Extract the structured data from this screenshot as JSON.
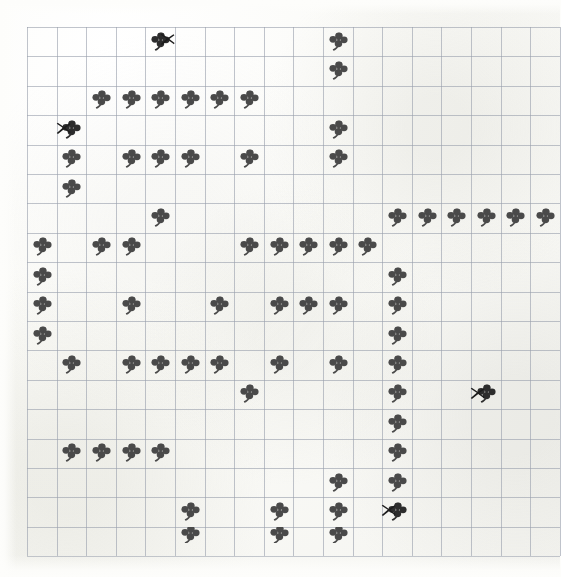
{
  "chart_data": {
    "type": "heatmap",
    "title": "",
    "subtitle": "",
    "xlabel": "",
    "ylabel": "",
    "grid": {
      "columns": 18,
      "rows": 18,
      "cell_width": 29.6,
      "cell_height": 29.4,
      "origin_x": 27,
      "origin_y": 27,
      "line_color": "#9aa0ad",
      "grid_on": true
    },
    "legend": [
      {
        "key": "clover",
        "label": "four-leaf clover stitch",
        "color": "#4a4a4a"
      },
      {
        "key": "clover-x",
        "label": "four-leaf clover with X mark",
        "color": "#1c1c1c"
      }
    ],
    "symbol_counts": {
      "clover": 86,
      "clover_marked": 4,
      "total": 90
    },
    "cells": [
      {
        "col": 4,
        "row": 0,
        "symbol": "clover",
        "marked": true,
        "mark_side": "right"
      },
      {
        "col": 10,
        "row": 0,
        "symbol": "clover",
        "marked": false
      },
      {
        "col": 10,
        "row": 1,
        "symbol": "clover",
        "marked": false
      },
      {
        "col": 2,
        "row": 2,
        "symbol": "clover",
        "marked": false
      },
      {
        "col": 3,
        "row": 2,
        "symbol": "clover",
        "marked": false
      },
      {
        "col": 4,
        "row": 2,
        "symbol": "clover",
        "marked": false
      },
      {
        "col": 5,
        "row": 2,
        "symbol": "clover",
        "marked": false
      },
      {
        "col": 6,
        "row": 2,
        "symbol": "clover",
        "marked": false
      },
      {
        "col": 7,
        "row": 2,
        "symbol": "clover",
        "marked": false
      },
      {
        "col": 1,
        "row": 3,
        "symbol": "clover",
        "marked": true,
        "mark_side": "left"
      },
      {
        "col": 10,
        "row": 3,
        "symbol": "clover",
        "marked": false
      },
      {
        "col": 1,
        "row": 4,
        "symbol": "clover",
        "marked": false
      },
      {
        "col": 3,
        "row": 4,
        "symbol": "clover",
        "marked": false
      },
      {
        "col": 4,
        "row": 4,
        "symbol": "clover",
        "marked": false
      },
      {
        "col": 5,
        "row": 4,
        "symbol": "clover",
        "marked": false
      },
      {
        "col": 7,
        "row": 4,
        "symbol": "clover",
        "marked": false
      },
      {
        "col": 10,
        "row": 4,
        "symbol": "clover",
        "marked": false
      },
      {
        "col": 1,
        "row": 5,
        "symbol": "clover",
        "marked": false
      },
      {
        "col": 4,
        "row": 6,
        "symbol": "clover",
        "marked": false
      },
      {
        "col": 12,
        "row": 6,
        "symbol": "clover",
        "marked": false
      },
      {
        "col": 13,
        "row": 6,
        "symbol": "clover",
        "marked": false
      },
      {
        "col": 14,
        "row": 6,
        "symbol": "clover",
        "marked": false
      },
      {
        "col": 15,
        "row": 6,
        "symbol": "clover",
        "marked": false
      },
      {
        "col": 16,
        "row": 6,
        "symbol": "clover",
        "marked": false
      },
      {
        "col": 17,
        "row": 6,
        "symbol": "clover",
        "marked": false
      },
      {
        "col": 0,
        "row": 7,
        "symbol": "clover",
        "marked": false
      },
      {
        "col": 2,
        "row": 7,
        "symbol": "clover",
        "marked": false
      },
      {
        "col": 3,
        "row": 7,
        "symbol": "clover",
        "marked": false
      },
      {
        "col": 7,
        "row": 7,
        "symbol": "clover",
        "marked": false
      },
      {
        "col": 8,
        "row": 7,
        "symbol": "clover",
        "marked": false
      },
      {
        "col": 9,
        "row": 7,
        "symbol": "clover",
        "marked": false
      },
      {
        "col": 10,
        "row": 7,
        "symbol": "clover",
        "marked": false
      },
      {
        "col": 11,
        "row": 7,
        "symbol": "clover",
        "marked": false
      },
      {
        "col": 0,
        "row": 8,
        "symbol": "clover",
        "marked": false
      },
      {
        "col": 12,
        "row": 8,
        "symbol": "clover",
        "marked": false
      },
      {
        "col": 0,
        "row": 9,
        "symbol": "clover",
        "marked": false
      },
      {
        "col": 3,
        "row": 9,
        "symbol": "clover",
        "marked": false
      },
      {
        "col": 6,
        "row": 9,
        "symbol": "clover",
        "marked": false
      },
      {
        "col": 8,
        "row": 9,
        "symbol": "clover",
        "marked": false
      },
      {
        "col": 9,
        "row": 9,
        "symbol": "clover",
        "marked": false
      },
      {
        "col": 10,
        "row": 9,
        "symbol": "clover",
        "marked": false
      },
      {
        "col": 12,
        "row": 9,
        "symbol": "clover",
        "marked": false
      },
      {
        "col": 0,
        "row": 10,
        "symbol": "clover",
        "marked": false
      },
      {
        "col": 12,
        "row": 10,
        "symbol": "clover",
        "marked": false
      },
      {
        "col": 1,
        "row": 11,
        "symbol": "clover",
        "marked": false
      },
      {
        "col": 3,
        "row": 11,
        "symbol": "clover",
        "marked": false
      },
      {
        "col": 4,
        "row": 11,
        "symbol": "clover",
        "marked": false
      },
      {
        "col": 5,
        "row": 11,
        "symbol": "clover",
        "marked": false
      },
      {
        "col": 6,
        "row": 11,
        "symbol": "clover",
        "marked": false
      },
      {
        "col": 8,
        "row": 11,
        "symbol": "clover",
        "marked": false
      },
      {
        "col": 10,
        "row": 11,
        "symbol": "clover",
        "marked": false
      },
      {
        "col": 12,
        "row": 11,
        "symbol": "clover",
        "marked": false
      },
      {
        "col": 7,
        "row": 12,
        "symbol": "clover",
        "marked": false
      },
      {
        "col": 12,
        "row": 12,
        "symbol": "clover",
        "marked": false
      },
      {
        "col": 15,
        "row": 12,
        "symbol": "clover",
        "marked": true,
        "mark_side": "left"
      },
      {
        "col": 12,
        "row": 13,
        "symbol": "clover",
        "marked": false
      },
      {
        "col": 1,
        "row": 14,
        "symbol": "clover",
        "marked": false
      },
      {
        "col": 2,
        "row": 14,
        "symbol": "clover",
        "marked": false
      },
      {
        "col": 3,
        "row": 14,
        "symbol": "clover",
        "marked": false
      },
      {
        "col": 4,
        "row": 14,
        "symbol": "clover",
        "marked": false
      },
      {
        "col": 12,
        "row": 14,
        "symbol": "clover",
        "marked": false
      },
      {
        "col": 10,
        "row": 15,
        "symbol": "clover",
        "marked": false
      },
      {
        "col": 12,
        "row": 15,
        "symbol": "clover",
        "marked": false
      },
      {
        "col": 5,
        "row": 16,
        "symbol": "clover",
        "marked": false
      },
      {
        "col": 8,
        "row": 16,
        "symbol": "clover",
        "marked": false
      },
      {
        "col": 10,
        "row": 16,
        "symbol": "clover",
        "marked": false
      },
      {
        "col": 12,
        "row": 16,
        "symbol": "clover",
        "marked": true,
        "mark_side": "left"
      },
      {
        "col": 5,
        "row": 17,
        "symbol": "clover-partial",
        "marked": false
      },
      {
        "col": 8,
        "row": 17,
        "symbol": "clover-partial",
        "marked": false
      },
      {
        "col": 10,
        "row": 17,
        "symbol": "clover-partial",
        "marked": false
      }
    ]
  },
  "page": {
    "media": "scanned graph paper",
    "background_color": "#fdfdfb",
    "symbol_color": "#4a4a4a",
    "mark_color": "#1c1c1c",
    "grid_line_color": "#9aa0ad"
  }
}
